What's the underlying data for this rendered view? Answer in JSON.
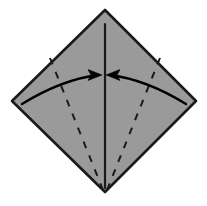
{
  "figure": {
    "name": "origami-fold-diagram",
    "canvas": {
      "width": 207,
      "height": 206
    },
    "background_color": "#ffffff"
  },
  "colors": {
    "paper_fill": "#9a9a9a",
    "paper_stroke": "#1a1a1a",
    "crease_line": "#1a1a1a",
    "fold_line": "#1a1a1a",
    "arrow": "#000000",
    "background": "#ffffff"
  },
  "shapes": {
    "paper_sheet": {
      "name": "paper-diamond",
      "kind": "polygon",
      "description": "Square sheet rotated 45 degrees forming a diamond",
      "points": "105,10 196,101 105,192 12,101",
      "vertices": {
        "top": [
          105,
          10
        ],
        "right": [
          196,
          101
        ],
        "bottom": [
          105,
          192
        ],
        "left": [
          12,
          101
        ]
      },
      "fill": "#9a9a9a",
      "stroke": "#1a1a1a",
      "stroke_width": 2.6
    },
    "center_crease": {
      "name": "vertical-center-crease",
      "kind": "line",
      "description": "Existing vertical valley crease from top vertex to bottom vertex",
      "x1": 105,
      "y1": 24,
      "x2": 105,
      "y2": 188,
      "stroke": "#1a1a1a",
      "stroke_width": 2.2,
      "dashed": false
    },
    "fold_lines": [
      {
        "name": "fold-line-left",
        "kind": "line",
        "description": "Dashed fold line from left vertex region down to bottom vertex",
        "x1": 50,
        "y1": 58,
        "x2": 103,
        "y2": 190,
        "stroke": "#1a1a1a",
        "stroke_width": 2.0,
        "dash_pattern": "7 8"
      },
      {
        "name": "fold-line-right",
        "kind": "line",
        "description": "Dashed fold line from right vertex region down to bottom vertex",
        "x1": 160,
        "y1": 58,
        "x2": 107,
        "y2": 190,
        "stroke": "#1a1a1a",
        "stroke_width": 2.0,
        "dash_pattern": "7 8"
      }
    ],
    "arrows": [
      {
        "name": "fold-arrow-left",
        "kind": "curved-arrow",
        "description": "Curved arrow sweeping from left vertex to the vertical center line, pointing right",
        "path": "M 22,104 C 48,88 74,78 98,75",
        "head_points": "101,75 90,70 92,75 90,80",
        "direction": "right",
        "stroke": "#000000",
        "stroke_width": 2.4
      },
      {
        "name": "fold-arrow-right",
        "kind": "curved-arrow",
        "description": "Curved arrow sweeping from right vertex to the vertical center line, pointing left",
        "path": "M 186,104 C 160,88 134,78 110,75",
        "head_points": "107,75 118,70 116,75 118,80",
        "direction": "left",
        "stroke": "#000000",
        "stroke_width": 2.4
      }
    ]
  },
  "labels": {
    "step_caption": "",
    "annotations": []
  }
}
